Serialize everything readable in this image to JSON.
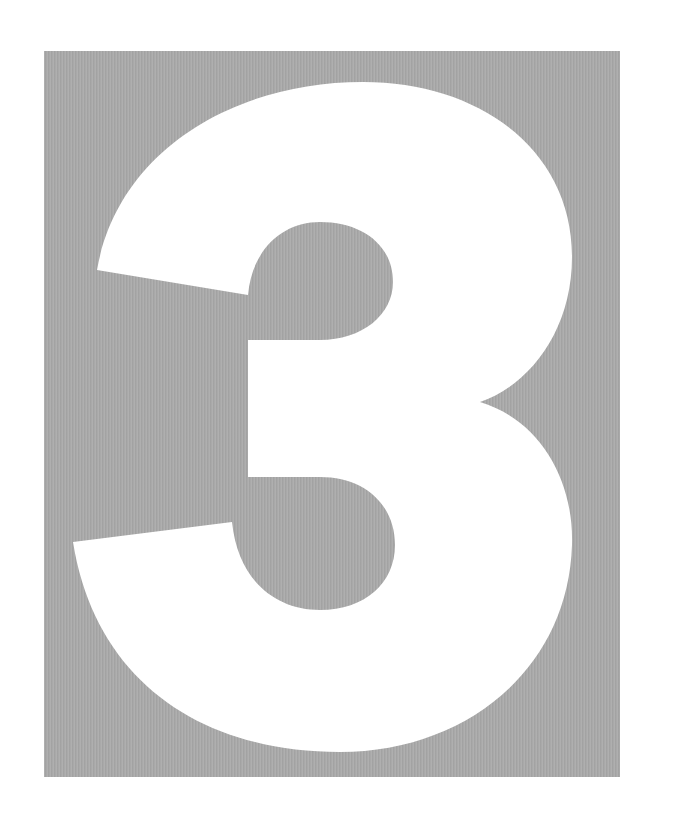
{
  "figure": {
    "numeral": "3",
    "background_color": "#ffffff",
    "panel_color": "#a9a9a9",
    "numeral_color": "#ffffff"
  }
}
